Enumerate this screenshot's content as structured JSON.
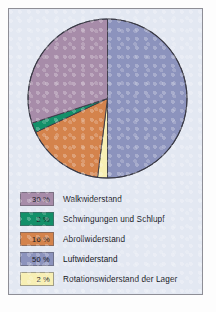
{
  "chart_data": {
    "type": "pie",
    "title": "",
    "unit": "%",
    "legend_position": "bottom",
    "start_angle_deg": 0,
    "direction": "clockwise",
    "categories": [
      "Luftwiderstand",
      "Rotationswiderstand der Lager",
      "Abrollwiderstand",
      "Schwingungen und Schlupf",
      "Walkwiderstand"
    ],
    "values": [
      50,
      2,
      16,
      2,
      30
    ],
    "slices": [
      {
        "label": "Luftwiderstand",
        "value": 50,
        "display": "50 %",
        "color": "#8c93bd"
      },
      {
        "label": "Rotationswiderstand der Lager",
        "value": 2,
        "display": "2 %",
        "color": "#f7efb4"
      },
      {
        "label": "Abrollwiderstand",
        "value": 16,
        "display": "16 %",
        "color": "#d4834c"
      },
      {
        "label": "Schwingungen und Schlupf",
        "value": 2,
        "display": "2 %",
        "color": "#139069"
      },
      {
        "label": "Walkwiderstand",
        "value": 30,
        "display": "30 %",
        "color": "#a78ca9"
      }
    ]
  },
  "legend": {
    "rows": [
      {
        "percent": "30 %",
        "label": "Walkwiderstand",
        "color": "#a78ca9"
      },
      {
        "percent": "2 %",
        "label": "Schwingungen und Schlupf",
        "color": "#139069"
      },
      {
        "percent": "16 %",
        "label": "Abrollwiderstand",
        "color": "#d4834c"
      },
      {
        "percent": "50 %",
        "label": "Luftwiderstand",
        "color": "#8c93bd"
      },
      {
        "percent": "2 %",
        "label": "Rotationswiderstand der Lager",
        "color": "#f7efb4"
      }
    ]
  },
  "colors": {
    "panel_background": "#e3e8f2",
    "panel_border": "#8e8e96",
    "slice_outline": "#3a3a46",
    "page_background": "#fdfdfd"
  }
}
